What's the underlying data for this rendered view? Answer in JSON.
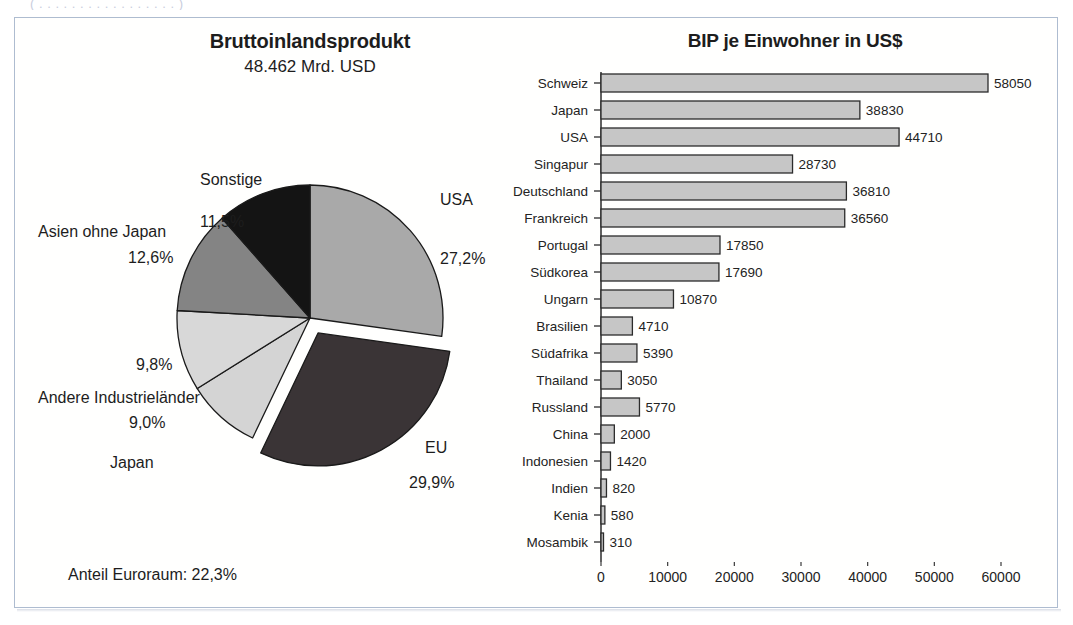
{
  "top_fragment": "( . . . . . . . . . . . . . . . . . )",
  "pie_panel": {
    "title": "Bruttoinlandsprodukt",
    "subtitle": "48.462 Mrd. USD",
    "footnote": "Anteil Euroraum: 22,3%"
  },
  "bar_panel": {
    "title": "BIP je Einwohner in US$"
  },
  "chart_data": [
    {
      "type": "pie",
      "title": "Bruttoinlandsprodukt",
      "subtitle": "48.462 Mrd. USD",
      "total_label": "48.462 Mrd. USD",
      "annotation": "Anteil Euroraum: 22,3%",
      "value_unit": "%",
      "start_angle_deg": 0,
      "direction": "clockwise",
      "labels": [
        "USA",
        "EU",
        "Japan",
        "Andere Industrieländer",
        "Asien ohne Japan",
        "Sonstige"
      ],
      "values": [
        27.2,
        29.9,
        9.0,
        9.8,
        12.6,
        11.5
      ],
      "value_labels": [
        "27,2%",
        "29,9%",
        "9,0%",
        "9,8%",
        "12,6%",
        "11,5%"
      ],
      "colors": [
        "#a9a9a9",
        "#3a3436",
        "#d4d4d4",
        "#d8d8d8",
        "#848484",
        "#141414"
      ],
      "exploded": [
        "EU"
      ],
      "legend": "none"
    },
    {
      "type": "bar",
      "orientation": "horizontal",
      "title": "BIP je Einwohner in US$",
      "xlabel": "",
      "ylabel": "",
      "xlim": [
        0,
        60000
      ],
      "xticks": [
        0,
        10000,
        20000,
        30000,
        40000,
        50000,
        60000
      ],
      "xtick_labels": [
        "0",
        "10000",
        "20000",
        "30000",
        "40000",
        "50000",
        "60000"
      ],
      "grid": false,
      "bar_color": "#c6c6c6",
      "bar_edge_color": "#2b2b2b",
      "categories": [
        "Schweiz",
        "Japan",
        "USA",
        "Singapur",
        "Deutschland",
        "Frankreich",
        "Portugal",
        "Südkorea",
        "Ungarn",
        "Brasilien",
        "Südafrika",
        "Thailand",
        "Russland",
        "China",
        "Indonesien",
        "Indien",
        "Kenia",
        "Mosambik"
      ],
      "values": [
        58050,
        38830,
        44710,
        28730,
        36810,
        36560,
        17850,
        17690,
        10870,
        4710,
        5390,
        3050,
        5770,
        2000,
        1420,
        820,
        580,
        310
      ],
      "value_labels": [
        "58050",
        "38830",
        "44710",
        "28730",
        "36810",
        "36560",
        "17850",
        "17690",
        "10870",
        "4710",
        "5390",
        "3050",
        "5770",
        "2000",
        "1420",
        "820",
        "580",
        "310"
      ]
    }
  ]
}
